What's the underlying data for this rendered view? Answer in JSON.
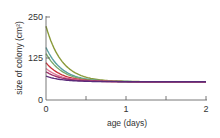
{
  "chart_data": {
    "type": "line",
    "title": "",
    "xlabel": "age (days)",
    "ylabel": "size of colony (cm²)",
    "xlim": [
      0,
      2
    ],
    "ylim": [
      0,
      250
    ],
    "x_ticks": [
      "0",
      "1",
      "2"
    ],
    "x_minor_ticks": [
      0.5,
      1.5
    ],
    "y_ticks": [
      "0",
      "125",
      "250"
    ],
    "grid": false,
    "legend": null,
    "asymptote": 55,
    "series": [
      {
        "name": "olive",
        "color": "#8a9a3a",
        "start": 222
      },
      {
        "name": "teal",
        "color": "#5aa0a0",
        "start": 158
      },
      {
        "name": "green",
        "color": "#7aaa6a",
        "start": 140
      },
      {
        "name": "red",
        "color": "#c8323a",
        "start": 112
      },
      {
        "name": "pink",
        "color": "#e07a9a",
        "start": 95
      },
      {
        "name": "magenta",
        "color": "#a0306a",
        "start": 85
      },
      {
        "name": "purple",
        "color": "#5a2a7a",
        "start": 72
      }
    ],
    "decay_rate": 5.0
  }
}
